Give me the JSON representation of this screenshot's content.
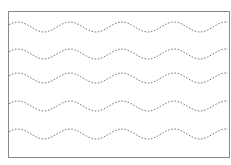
{
  "worksheet": {
    "type": "wavy-line-tracing",
    "frame": {
      "x": 8,
      "y": 11,
      "width": 221,
      "height": 146,
      "color": "#8a8a8a"
    },
    "wave": {
      "period": 52,
      "amplitude": 5,
      "phase_start_x": 18,
      "stroke_color": "#7a7a7a",
      "dash": "1.6 1.6"
    },
    "lines": [
      {
        "center_y": 27
      },
      {
        "center_y": 54
      },
      {
        "center_y": 78
      },
      {
        "center_y": 106
      },
      {
        "center_y": 134
      }
    ]
  }
}
